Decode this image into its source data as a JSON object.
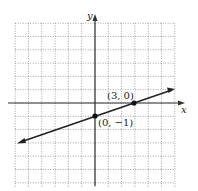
{
  "chart_data": {
    "type": "line",
    "title": "",
    "xlabel": "x",
    "ylabel": "y",
    "xlim": [
      -6,
      6
    ],
    "ylim": [
      -6,
      6
    ],
    "grid": true,
    "grid_style": "dotted",
    "series": [
      {
        "name": "line through (0,-1) and (3,0)",
        "equation": "y = (1/3)x - 1",
        "slope": 0.3333,
        "intercept": -1,
        "x": [
          -6,
          6
        ],
        "y": [
          -3,
          1
        ],
        "arrows": "both"
      }
    ],
    "points": [
      {
        "x": 3,
        "y": 0,
        "label": "(3, 0)"
      },
      {
        "x": 0,
        "y": -1,
        "label": "(0, −1)"
      }
    ]
  },
  "labels": {
    "x_axis": "x",
    "y_axis": "y",
    "point_a": "(3, 0)",
    "point_b": "(0, −1)"
  },
  "colors": {
    "axis": "#333333",
    "grid": "#888888",
    "line": "#222222",
    "point": "#111111"
  }
}
